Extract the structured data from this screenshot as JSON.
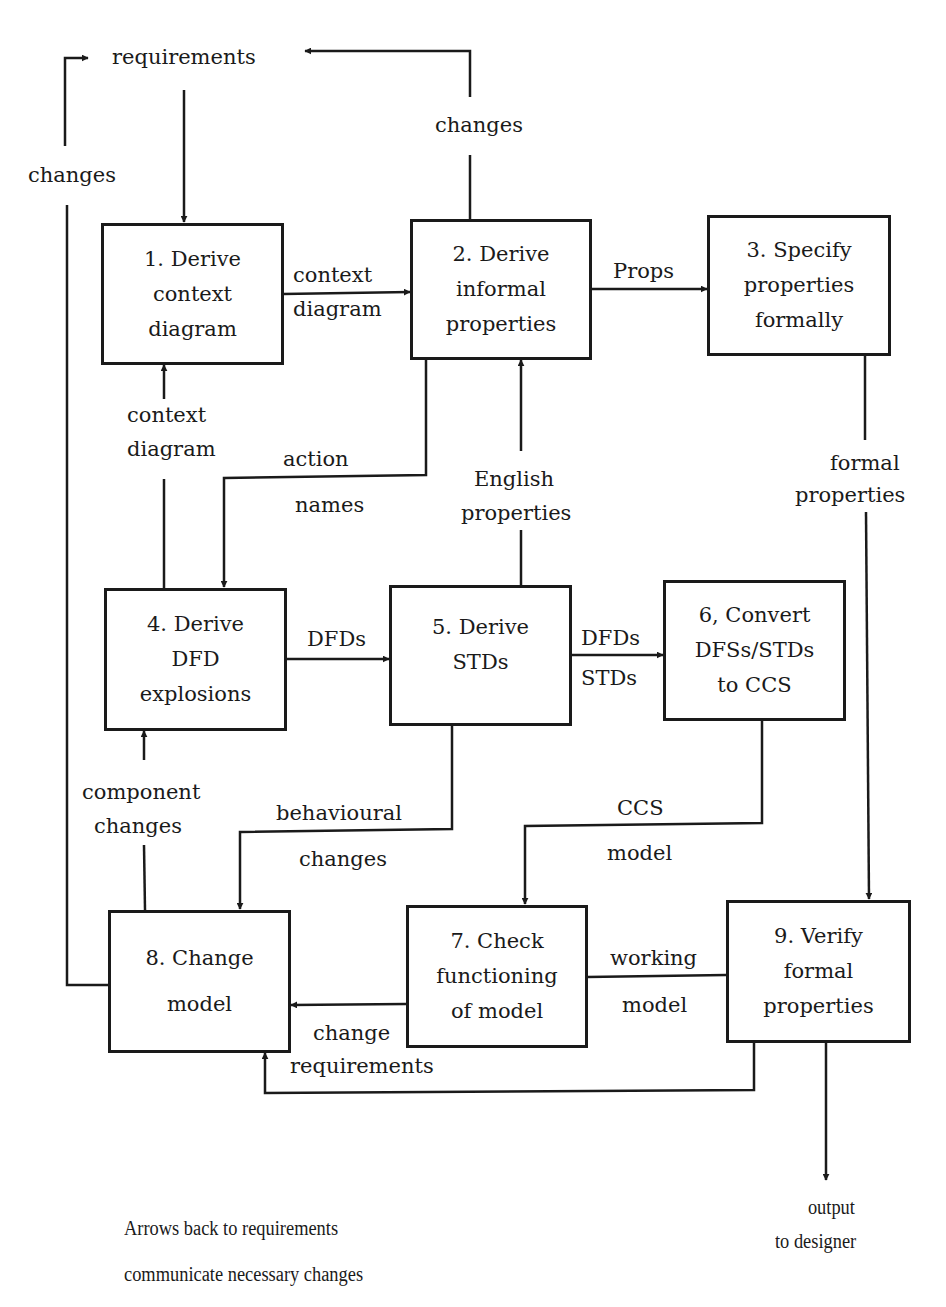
{
  "diagram": {
    "source": {
      "label": "requirements"
    },
    "boxes": [
      {
        "id": 1,
        "lines": [
          "1. Derive",
          "context",
          "diagram"
        ]
      },
      {
        "id": 2,
        "lines": [
          "2. Derive",
          "informal",
          "properties"
        ]
      },
      {
        "id": 3,
        "lines": [
          "3. Specify",
          "properties",
          "formally"
        ]
      },
      {
        "id": 4,
        "lines": [
          "4. Derive",
          "DFD",
          "explosions"
        ]
      },
      {
        "id": 5,
        "lines": [
          "5. Derive",
          "STDs"
        ]
      },
      {
        "id": 6,
        "lines": [
          "6, Convert",
          "DFSs/STDs",
          "to CCS"
        ]
      },
      {
        "id": 7,
        "lines": [
          "7. Check",
          "functioning",
          "of model"
        ]
      },
      {
        "id": 8,
        "lines": [
          "8. Change",
          "model"
        ]
      },
      {
        "id": 9,
        "lines": [
          "9. Verify",
          "formal",
          "properties"
        ]
      }
    ],
    "edges": [
      {
        "from": "requirements",
        "to": "1",
        "label": ""
      },
      {
        "from": "1",
        "to": "2",
        "label": [
          "context",
          "diagram"
        ]
      },
      {
        "from": "2",
        "to": "requirements",
        "label": [
          "changes"
        ]
      },
      {
        "from": "2",
        "to": "3",
        "label": [
          "Props"
        ]
      },
      {
        "from": "2",
        "to": "4",
        "label": [
          "action",
          "names"
        ]
      },
      {
        "from": "4",
        "to": "1",
        "label": [
          "context",
          "diagram"
        ]
      },
      {
        "from": "5",
        "to": "2",
        "label": [
          "English",
          "properties"
        ]
      },
      {
        "from": "3",
        "to": "9",
        "label": [
          "formal",
          "properties"
        ]
      },
      {
        "from": "4",
        "to": "5",
        "label": [
          "DFDs"
        ]
      },
      {
        "from": "5",
        "to": "6",
        "label": [
          "DFDs",
          "STDs"
        ]
      },
      {
        "from": "8",
        "to": "4",
        "label": [
          "component",
          "changes"
        ]
      },
      {
        "from": "5",
        "to": "8",
        "label": [
          "behavioural",
          "changes"
        ]
      },
      {
        "from": "6",
        "to": "7",
        "label": [
          "CCS",
          "model"
        ]
      },
      {
        "from": "7",
        "to": "8",
        "label": [
          "change",
          "requirements"
        ]
      },
      {
        "from": "7",
        "to": "9",
        "label": [
          "working",
          "model"
        ]
      },
      {
        "from": "9",
        "to": "8",
        "label": ""
      },
      {
        "from": "8",
        "to": "requirements",
        "label": [
          "changes"
        ]
      },
      {
        "from": "9",
        "to": "output",
        "label": [
          "output",
          "to designer"
        ]
      }
    ],
    "note": [
      "Arrows back to requirements",
      "communicate necessary changes"
    ]
  }
}
